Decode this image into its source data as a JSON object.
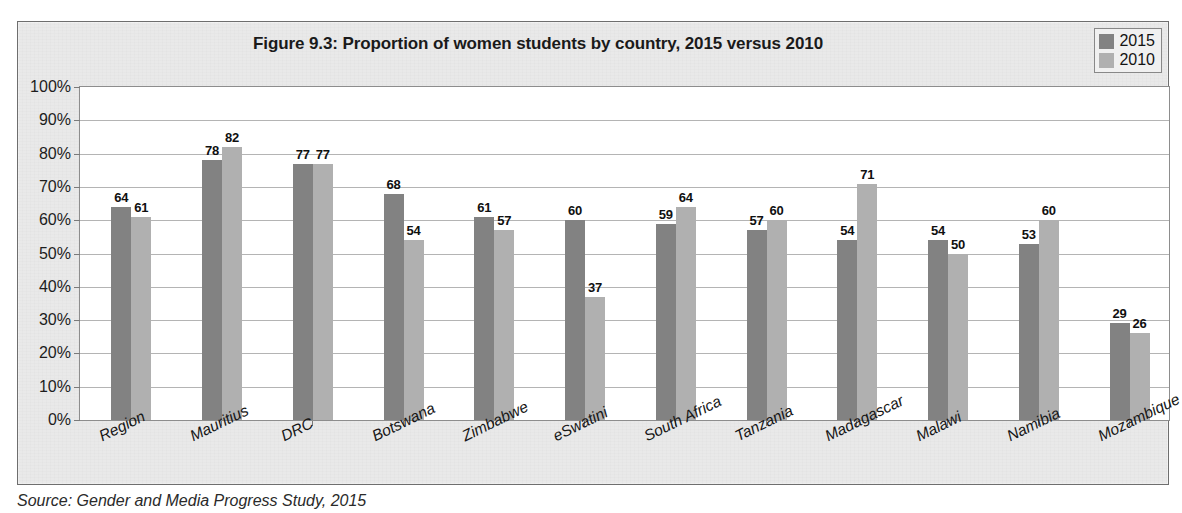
{
  "chart_data": {
    "type": "bar",
    "title": "Figure 9.3: Proportion of women students by country, 2015 versus 2010",
    "xlabel": "",
    "ylabel": "",
    "ylim": [
      0,
      100
    ],
    "ytick_labels": [
      "100%",
      "90%",
      "80%",
      "70%",
      "60%",
      "50%",
      "40%",
      "30%",
      "20%",
      "10%",
      "0%"
    ],
    "ytick_values": [
      100,
      90,
      80,
      70,
      60,
      50,
      40,
      30,
      20,
      10,
      0
    ],
    "grid": true,
    "legend_position": "top-right",
    "categories": [
      "Region",
      "Mauritius",
      "DRC",
      "Botswana",
      "Zimbabwe",
      "eSwatini",
      "South Africa",
      "Tanzania",
      "Madagascar",
      "Malawi",
      "Namibia",
      "Mozambique"
    ],
    "series": [
      {
        "name": "2015",
        "color": "#828282",
        "values": [
          64,
          78,
          77,
          68,
          61,
          60,
          59,
          57,
          54,
          54,
          53,
          29
        ]
      },
      {
        "name": "2010",
        "color": "#b0b0b0",
        "values": [
          61,
          82,
          77,
          54,
          57,
          37,
          64,
          60,
          71,
          50,
          60,
          26
        ]
      }
    ]
  },
  "source_note": "Source: Gender and Media Progress Study, 2015"
}
